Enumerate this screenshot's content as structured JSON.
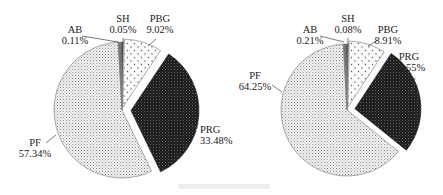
{
  "chart_data": [
    {
      "type": "pie",
      "title": "",
      "categories": [
        "SH",
        "PBG",
        "PRG",
        "PF",
        "AB"
      ],
      "values": [
        0.05,
        9.02,
        33.48,
        57.34,
        0.11
      ],
      "labels": [
        "0.05%",
        "9.02%",
        "33.48%",
        "57.34%",
        "0.11%"
      ],
      "exploded": [
        "PBG",
        "PRG"
      ],
      "legend": "none (inline labels)"
    },
    {
      "type": "pie",
      "title": "",
      "categories": [
        "SH",
        "PBG",
        "PRG",
        "PF",
        "AB"
      ],
      "values": [
        0.08,
        8.91,
        26.55,
        64.25,
        0.21
      ],
      "labels": [
        "0.08%",
        "8.91%",
        "26.55%",
        "64.25%",
        "0.21%"
      ],
      "exploded": [
        "PBG",
        "PRG"
      ],
      "legend": "none (inline labels)"
    }
  ],
  "pies": [
    {
      "cx": 122,
      "cy": 110,
      "r": 68,
      "slices": [
        {
          "name": "SH",
          "value": 0.05,
          "pct": "0.05%",
          "fill": "sh",
          "explode": 0,
          "lx": 123,
          "ly": 22,
          "tx": 123,
          "ty": 22,
          "anchor": "middle",
          "line": [
            123,
            38,
            123,
            44
          ]
        },
        {
          "name": "PBG",
          "value": 9.02,
          "pct": "9.02%",
          "fill": "pbg",
          "explode": 3,
          "lx": 160,
          "ly": 22,
          "tx": 160,
          "ty": 22,
          "anchor": "middle",
          "line": [
            156,
            39,
            148,
            46
          ]
        },
        {
          "name": "PRG",
          "value": 33.48,
          "pct": "33.48%",
          "fill": "prg",
          "explode": 9,
          "lx": 200,
          "ly": 133,
          "tx": 200,
          "ty": 133,
          "anchor": "start",
          "line": [
            198,
            128,
            190,
            125
          ]
        },
        {
          "name": "PF",
          "value": 57.34,
          "pct": "57.34%",
          "fill": "pf",
          "explode": 0,
          "lx": 35,
          "ly": 146,
          "tx": 35,
          "ty": 146,
          "anchor": "middle",
          "line": [
            46,
            143,
            56,
            135
          ]
        },
        {
          "name": "AB",
          "value": 0.11,
          "pct": "0.11%",
          "fill": "ab",
          "explode": 0,
          "lx": 75,
          "ly": 33,
          "tx": 75,
          "ty": 33,
          "anchor": "middle",
          "line": [
            82,
            36,
            118,
            42
          ]
        }
      ]
    },
    {
      "cx": 347,
      "cy": 110,
      "r": 66,
      "slices": [
        {
          "name": "SH",
          "value": 0.08,
          "pct": "0.08%",
          "fill": "sh",
          "explode": 0,
          "lx": 348,
          "ly": 22,
          "tx": 348,
          "ty": 22,
          "anchor": "middle",
          "line": [
            348,
            38,
            348,
            44
          ]
        },
        {
          "name": "PBG",
          "value": 8.91,
          "pct": "8.91%",
          "fill": "pbg",
          "explode": 3,
          "lx": 388,
          "ly": 33,
          "tx": 388,
          "ty": 33,
          "anchor": "middle",
          "line": [
            378,
            40,
            368,
            46
          ]
        },
        {
          "name": "PRG",
          "value": 26.55,
          "pct": "26.55%",
          "fill": "prg",
          "explode": 8,
          "lx": 409,
          "ly": 60,
          "tx": 409,
          "ty": 60,
          "anchor": "middle",
          "line": [
            415,
            78,
            412,
            92
          ]
        },
        {
          "name": "PF",
          "value": 64.25,
          "pct": "64.25%",
          "fill": "pf",
          "explode": 0,
          "lx": 255,
          "ly": 79,
          "tx": 255,
          "ty": 79,
          "anchor": "middle",
          "line": [
            272,
            85,
            282,
            92
          ]
        },
        {
          "name": "AB",
          "value": 0.21,
          "pct": "0.21%",
          "fill": "ab",
          "explode": 0,
          "lx": 310,
          "ly": 33,
          "tx": 310,
          "ty": 33,
          "anchor": "middle",
          "line": [
            320,
            36,
            344,
            42
          ]
        }
      ]
    }
  ],
  "caption": {
    "visible": true,
    "legible": false
  }
}
